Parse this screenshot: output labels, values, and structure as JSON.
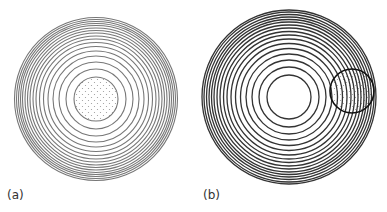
{
  "figure": {
    "panels": [
      {
        "id": "a",
        "label": "(a)",
        "label_pos": [
          7,
          188
        ],
        "center": [
          96,
          99
        ],
        "outer_radius": 82,
        "rings": [
          22,
          30,
          37,
          43,
          48,
          52.5,
          56.5,
          60,
          63,
          66,
          68.5,
          71,
          73.5,
          75.5,
          77.5,
          79.5,
          81.5
        ],
        "ring_color": "#777777",
        "dotted_region": {
          "cx": 96,
          "cy": 99,
          "r": 22,
          "dot_color": "#999999"
        }
      },
      {
        "id": "b",
        "label": "(b)",
        "label_pos": [
          203,
          188
        ],
        "center": [
          289,
          97
        ],
        "outer_radius": 87,
        "rings": [
          22,
          30,
          37,
          43,
          48.5,
          53.5,
          58,
          62,
          65.5,
          69,
          72,
          75,
          77.5,
          80,
          82.5,
          85,
          87
        ],
        "ring_color": "#333333",
        "highlight_circle": {
          "cx": 352,
          "cy": 91,
          "r": 22,
          "stroke_color": "#111111",
          "dot_color": "#999999"
        }
      }
    ]
  }
}
